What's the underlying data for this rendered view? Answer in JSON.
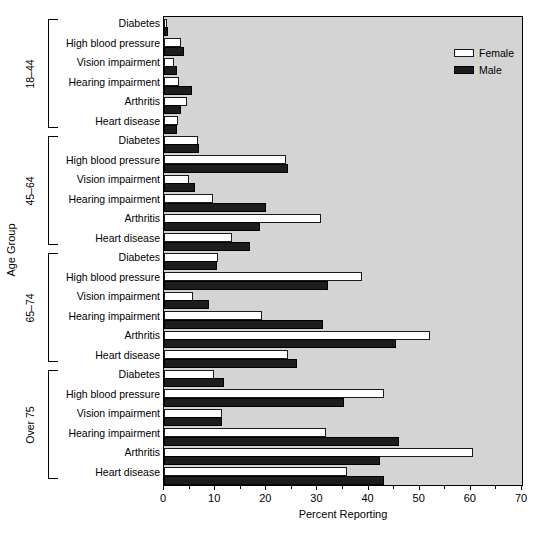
{
  "chart_data": {
    "type": "bar",
    "orientation": "horizontal",
    "title": "",
    "xlabel": "Percent Reporting",
    "ylabel": "Age Group",
    "xlim": [
      0,
      70
    ],
    "xticks": [
      0,
      10,
      20,
      30,
      40,
      50,
      60,
      70
    ],
    "xtick_labels": [
      "0",
      "10",
      "20",
      "30",
      "40",
      "50",
      "60",
      "70"
    ],
    "minor_tick_step": 5,
    "grid": false,
    "legend_position": "top-right",
    "legend": [
      "Female",
      "Male"
    ],
    "categories": [
      "Diabetes",
      "High blood pressure",
      "Vision impairment",
      "Hearing impairment",
      "Arthritis",
      "Heart disease"
    ],
    "groups": [
      {
        "label": "18–44",
        "series": [
          {
            "name": "Female",
            "values": [
              0.6,
              3.4,
              2.0,
              3.0,
              4.5,
              2.8
            ]
          },
          {
            "name": "Male",
            "values": [
              0.7,
              4.0,
              2.6,
              5.5,
              3.4,
              2.6
            ]
          }
        ]
      },
      {
        "label": "45–64",
        "series": [
          {
            "name": "Female",
            "values": [
              6.6,
              23.8,
              4.8,
              9.6,
              30.7,
              13.2
            ]
          },
          {
            "name": "Male",
            "values": [
              6.8,
              24.2,
              6.0,
              20.0,
              18.8,
              16.8
            ]
          }
        ]
      },
      {
        "label": "65–74",
        "series": [
          {
            "name": "Female",
            "values": [
              10.6,
              38.8,
              5.6,
              19.2,
              52.0,
              24.2
            ]
          },
          {
            "name": "Male",
            "values": [
              10.4,
              32.0,
              8.8,
              31.0,
              45.4,
              26.0
            ]
          }
        ]
      },
      {
        "label": "Over 75",
        "series": [
          {
            "name": "Female",
            "values": [
              9.8,
              43.0,
              11.4,
              31.6,
              60.5,
              35.8
            ]
          },
          {
            "name": "Male",
            "values": [
              11.8,
              35.2,
              11.4,
              46.0,
              42.2,
              43.0
            ]
          }
        ]
      }
    ]
  },
  "legend": {
    "female_label": "Female",
    "male_label": "Male"
  },
  "axes": {
    "x_title": "Percent Reporting",
    "y_title": "Age Group",
    "x_tick_labels": [
      "0",
      "10",
      "20",
      "30",
      "40",
      "50",
      "60",
      "70"
    ]
  },
  "colors": {
    "female_fill": "#ffffff",
    "male_fill": "#1d1d1d",
    "plot_background": "#d4d4d4",
    "axis_line": "#000000",
    "page_background": "#ffffff"
  }
}
